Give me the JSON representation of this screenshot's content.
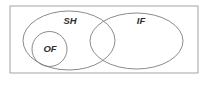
{
  "diagram": {
    "type": "venn-diagram",
    "title": "",
    "canvas": {
      "width": 211,
      "height": 86,
      "background": "#ffffff"
    },
    "universe": {
      "name": "universal-set-rectangle",
      "label": "",
      "x": 10,
      "y": 6,
      "width": 188,
      "height": 67,
      "stroke": "#9a9a9a",
      "fill": "#ffffff"
    },
    "sets": [
      {
        "id": "sh",
        "label": "SH",
        "shape": "ellipse",
        "cx": 69,
        "cy": 40.5,
        "rx": 46,
        "ry": 29.5,
        "stroke": "#7d7d7d",
        "fill": "none",
        "label_x": 70,
        "label_y": 21
      },
      {
        "id": "if",
        "label": "IF",
        "shape": "ellipse",
        "cx": 136.5,
        "cy": 41,
        "rx": 46.5,
        "ry": 28,
        "stroke": "#7d7d7d",
        "fill": "none",
        "label_x": 141,
        "label_y": 21
      },
      {
        "id": "of",
        "label": "OF",
        "shape": "circle",
        "cx": 49.5,
        "cy": 49,
        "rx": 17.5,
        "ry": 17.5,
        "stroke": "#7d7d7d",
        "fill": "none",
        "label_x": 50,
        "label_y": 49
      }
    ],
    "label_font_size": 9.5,
    "label_color": "#2e2e2e"
  }
}
